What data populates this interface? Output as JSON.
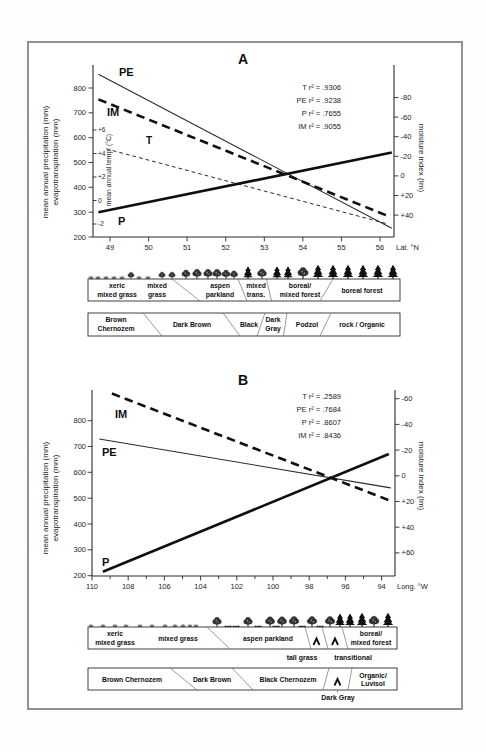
{
  "figure": {
    "icons": [
      "grass-tuft-icon",
      "bush-icon",
      "deciduous-tree-icon",
      "conifer-tree-icon"
    ],
    "bands_a": {
      "vegetation": {
        "zones": [
          [
            "xeric",
            "mixed grass"
          ],
          [
            "mixed",
            "grass"
          ],
          [
            "aspen",
            "parkland"
          ],
          [
            "mixed",
            "trans."
          ],
          [
            "boreal/",
            "mixed forest"
          ],
          [
            "boreal forest"
          ]
        ]
      },
      "soil": {
        "zones": [
          [
            "Brown",
            "Chernozem"
          ],
          [
            "Dark Brown"
          ],
          [
            "Black"
          ],
          [
            "Dark",
            "Gray"
          ],
          [
            "Podzol"
          ],
          [
            "rock / Organic"
          ]
        ]
      }
    },
    "bands_b": {
      "vegetation": {
        "zones": [
          [
            "xeric",
            "mixed grass"
          ],
          [
            "mixed grass"
          ],
          [
            "aspen parkland"
          ],
          [
            "boreal/",
            "mixed forest"
          ]
        ],
        "callouts": [
          "tall grass",
          "transitional"
        ]
      },
      "soil": {
        "zones": [
          [
            "Brown Chernozem"
          ],
          [
            "Dark Brown"
          ],
          [
            "Black Chernozem"
          ],
          [
            "Organic/",
            "Luvisol"
          ]
        ],
        "callouts": [
          "Dark Gray"
        ]
      }
    }
  },
  "chart_data": [
    {
      "id": "A",
      "type": "line",
      "title": "A",
      "x_axis": {
        "label": "Lat. °N",
        "ticks": [
          "49",
          "50",
          "51",
          "52",
          "53",
          "54",
          "55",
          "56"
        ],
        "range": [
          48.6,
          56.4
        ]
      },
      "y_left": {
        "label_line1": "mean annual precipitation (mm)",
        "label_line2": "evapotranspiration (mm)",
        "ticks": [
          "800",
          "700",
          "600",
          "500",
          "400",
          "300",
          "200"
        ],
        "range": [
          200,
          890
        ]
      },
      "y_temp": {
        "label": "mean annual temp. (°C)",
        "ticks": [
          "+6",
          "+4",
          "+2",
          "0",
          "-2"
        ]
      },
      "y_right": {
        "label": "moisture index (Im)",
        "ticks": [
          "-80",
          "-60",
          "-40",
          "-20",
          "0",
          "+20",
          "+40"
        ],
        "inverted": true
      },
      "legend": [
        "T r² = .9306",
        "PE r² = .9238",
        "P r² = .7655",
        "IM r² = .9055"
      ],
      "series": [
        {
          "name": "T",
          "axis": "temp",
          "r2": 0.9306,
          "style": "thin-dashed",
          "x": [
            48.9,
            56.2
          ],
          "y": [
            4.4,
            -2.0
          ]
        },
        {
          "name": "PE",
          "axis": "left",
          "r2": 0.9238,
          "style": "thin-solid",
          "x": [
            48.7,
            56.3
          ],
          "y": [
            855,
            235
          ]
        },
        {
          "name": "P",
          "axis": "left",
          "r2": 0.7655,
          "style": "thick-solid",
          "x": [
            48.7,
            56.3
          ],
          "y": [
            300,
            540
          ]
        },
        {
          "name": "IM",
          "axis": "right",
          "r2": 0.9055,
          "style": "thick-dashed",
          "x": [
            48.7,
            56.2
          ],
          "y": [
            -78,
            41
          ]
        }
      ]
    },
    {
      "id": "B",
      "type": "line",
      "title": "B",
      "x_axis": {
        "label": "Long. °W",
        "ticks": [
          "110",
          "108",
          "106",
          "104",
          "102",
          "100",
          "98",
          "96",
          "94"
        ],
        "range": [
          110,
          93.2
        ]
      },
      "y_left": {
        "label_line1": "mean annual precipitation (mm)",
        "label_line2": "evapotranspiration (mm)",
        "ticks": [
          "800",
          "700",
          "600",
          "500",
          "400",
          "300",
          "200"
        ],
        "range": [
          200,
          890
        ]
      },
      "y_right": {
        "label": "moisture index (Im)",
        "ticks": [
          "-60",
          "-40",
          "-20",
          "0",
          "+20",
          "+40",
          "+60"
        ],
        "inverted": true
      },
      "legend": [
        "T r² = .2589",
        "PE r² = .7684",
        "P r² = .8607",
        "IM r² = .8436"
      ],
      "series": [
        {
          "name": "T",
          "r2": 0.2589
        },
        {
          "name": "PE",
          "axis": "left",
          "r2": 0.7684,
          "style": "thin-solid",
          "x": [
            109.6,
            93.5
          ],
          "y": [
            729,
            540
          ]
        },
        {
          "name": "P",
          "axis": "left",
          "r2": 0.8607,
          "style": "thick-solid",
          "x": [
            109.4,
            93.6
          ],
          "y": [
            215,
            671
          ]
        },
        {
          "name": "IM",
          "axis": "right",
          "r2": 0.8436,
          "style": "thick-dashed",
          "x": [
            108.9,
            93.4
          ],
          "y": [
            -64,
            20
          ]
        }
      ]
    }
  ]
}
